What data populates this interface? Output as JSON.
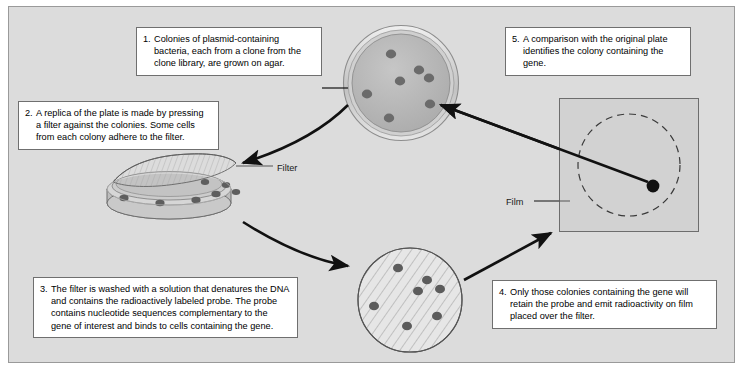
{
  "figure": {
    "background_color": "#ffffff",
    "panel_color": "#dcdcdc",
    "panel_border_color": "#9a9a9a"
  },
  "captions": [
    {
      "number": "1.",
      "text": "Colonies of plasmid-containing bacteria, each from a clone from the clone library, are grown on agar.",
      "name": "caption-step-1"
    },
    {
      "number": "2.",
      "text": "A replica of the plate is made by pressing a filter against the colonies. Some cells from each colony adhere to the filter.",
      "name": "caption-step-2"
    },
    {
      "number": "3.",
      "text": "The filter is washed with a solution that denatures the DNA and contains the radioactively labeled probe. The probe contains nucleotide sequences complementary to the gene of interest and binds to cells containing the gene.",
      "name": "caption-step-3"
    },
    {
      "number": "4.",
      "text": "Only those colonies containing the gene will retain the probe and emit radioactivity on film placed over the filter.",
      "name": "caption-step-4"
    },
    {
      "number": "5.",
      "text": "A comparison with the original plate identifies the colony containing the gene.",
      "name": "caption-step-5"
    }
  ],
  "labels": {
    "filter": "Filter",
    "film": "Film"
  },
  "colors": {
    "colony_fill": "#6b6b6b",
    "agar_fill": "#b9b9b9",
    "dish_rim": "#cfcfcf",
    "film_fill": "#d2d2d2",
    "filter_fill": "#e4e4e4",
    "arrow": "#111111",
    "hatch": "#9f9f9f",
    "exposed_spot": "#111111"
  },
  "illustrations": {
    "agar_plate": {
      "name": "agar-plate-with-colonies",
      "center": [
        401,
        83
      ],
      "radius": 57,
      "colony_count": 7,
      "colonies": [
        [
          391,
          54
        ],
        [
          419,
          70
        ],
        [
          428,
          78
        ],
        [
          400,
          81
        ],
        [
          367,
          94
        ],
        [
          429,
          104
        ],
        [
          389,
          118
        ]
      ],
      "highlighted_colony": [
        429,
        104
      ]
    },
    "replica_plate": {
      "name": "replica-plate-with-filter",
      "center": [
        169,
        192
      ],
      "filter_peeled": true,
      "colony_count": 6
    },
    "hybridized_filter": {
      "name": "hybridized-filter-disc",
      "center": [
        410,
        300
      ],
      "radius": 52,
      "hatched": true,
      "spot_count": 7,
      "spots": [
        [
          398,
          268
        ],
        [
          427,
          280
        ],
        [
          418,
          290
        ],
        [
          438,
          289
        ],
        [
          375,
          306
        ],
        [
          436,
          315
        ],
        [
          408,
          325
        ]
      ]
    },
    "film": {
      "name": "autoradiograph-film",
      "rect": [
        559,
        98,
        140,
        134
      ],
      "dashed_circle_center": [
        629,
        165
      ],
      "dashed_circle_radius": 51,
      "exposed_spot": [
        653,
        185
      ],
      "exposed_spot_radius": 6
    }
  },
  "arrows": [
    {
      "name": "arrow-plate-to-replica",
      "style": "curved",
      "from": "agar-plate",
      "to": "replica-plate"
    },
    {
      "name": "arrow-replica-to-filter",
      "style": "curved",
      "from": "replica-plate",
      "to": "hybridized-filter"
    },
    {
      "name": "arrow-filter-to-film",
      "style": "straight",
      "from": "hybridized-filter",
      "to": "film"
    },
    {
      "name": "arrow-film-to-plate",
      "style": "straight",
      "from": "film-exposed-spot",
      "to": "agar-plate-colony"
    }
  ]
}
